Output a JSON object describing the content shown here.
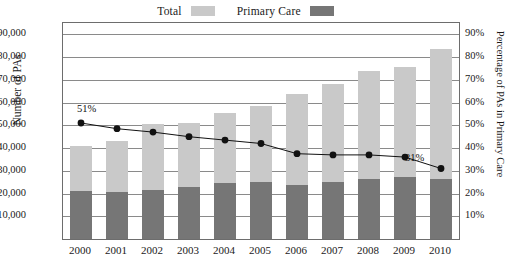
{
  "chart_data": {
    "type": "bar",
    "title": "",
    "subtitle": "",
    "xlabel": "",
    "ylabel": "Number of PAs",
    "y2label": "Percentage of PAs in Primary Care",
    "grid": true,
    "legend_position": "top-center",
    "categories": [
      "2000",
      "2001",
      "2002",
      "2003",
      "2004",
      "2005",
      "2006",
      "2007",
      "2008",
      "2009",
      "2010"
    ],
    "ylim": [
      0,
      95000
    ],
    "y2lim": [
      0,
      95
    ],
    "yticks": [
      "10,000",
      "20,000",
      "30,000",
      "40,000",
      "50,000",
      "60,000",
      "70,000",
      "80,000",
      "90,000"
    ],
    "ytick_values": [
      10000,
      20000,
      30000,
      40000,
      50000,
      60000,
      70000,
      80000,
      90000
    ],
    "y2ticks": [
      "10%",
      "20%",
      "30%",
      "40%",
      "50%",
      "60%",
      "70%",
      "80%",
      "90%"
    ],
    "y2tick_values": [
      10,
      20,
      30,
      40,
      50,
      60,
      70,
      80,
      90
    ],
    "series": [
      {
        "name": "Total",
        "type": "bar",
        "color": "#c9c9c9",
        "axis": "left",
        "values": [
          41000,
          43000,
          50500,
          51000,
          55500,
          58500,
          64000,
          68000,
          73800,
          75500,
          83500
        ]
      },
      {
        "name": "Primary Care",
        "type": "bar",
        "color": "#767676",
        "axis": "left",
        "values": [
          21200,
          20800,
          21500,
          23000,
          24500,
          25200,
          23800,
          25000,
          26200,
          27500,
          26300
        ]
      },
      {
        "name": "Percentage of PAs in Primary Care",
        "type": "line",
        "color": "#111111",
        "axis": "right",
        "values": [
          51.0,
          48.5,
          47.0,
          45.0,
          43.5,
          42.0,
          37.5,
          37.0,
          37.0,
          36.0,
          31.0
        ]
      }
    ],
    "annotations": [
      {
        "text": "51%",
        "category": "2000",
        "value": 51.0
      },
      {
        "text": "31%",
        "category": "2010",
        "value": 31.0
      }
    ]
  },
  "legend": {
    "items": [
      {
        "label": "Total",
        "color": "#c9c9c9"
      },
      {
        "label": "Primary Care",
        "color": "#767676"
      }
    ]
  },
  "axes": {
    "left_title": "Number of PAs",
    "right_title": "Percentage of PAs in Primary Care"
  }
}
